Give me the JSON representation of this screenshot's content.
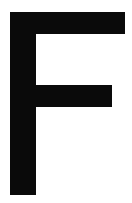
{
  "image": {
    "width": 132,
    "height": 203,
    "background_color": "#ffffff",
    "alt_text": "Black capital letter F on white background"
  },
  "glyph": {
    "character": "F",
    "name": "letter-f",
    "color": "#0a0a0a",
    "style": "sans-serif-bold-block",
    "edge_softness_px": 1,
    "metrics": {
      "stem_left": 10,
      "stem_right": 36,
      "stem_top": 12,
      "stem_bottom": 195,
      "stem_width": 26,
      "top_arm_right": 125,
      "top_arm_top": 12,
      "top_arm_bottom": 34,
      "top_arm_height": 22,
      "mid_arm_right": 112,
      "mid_arm_top": 85,
      "mid_arm_bottom": 107,
      "mid_arm_height": 22
    },
    "path": "M 10 12 L 125 12 L 125 34 L 36 34 L 36 85 L 112 85 L 112 107 L 36 107 L 36 195 L 10 195 Z"
  }
}
